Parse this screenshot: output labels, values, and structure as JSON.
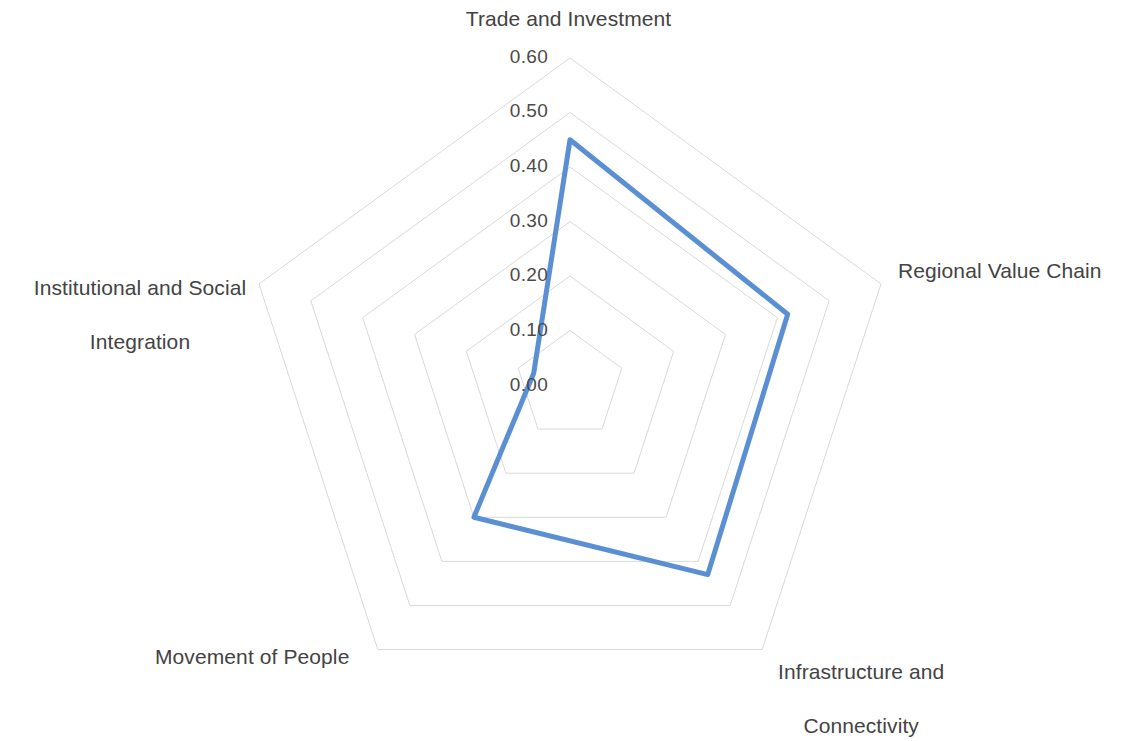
{
  "chart_data": {
    "type": "radar",
    "title": "",
    "subtitle": "",
    "categories": [
      "Trade and Investment",
      "Regional Value Chain",
      "Infrastructure and\nConnectivity",
      "Movement of People",
      "Institutional and Social\nIntegration"
    ],
    "series": [
      {
        "name": "Integration Index",
        "values": [
          0.45,
          0.42,
          0.43,
          0.3,
          0.07
        ],
        "color": "#5B8FD3",
        "line_width": 5,
        "fill": "none"
      }
    ],
    "tick_labels": [
      "0.00",
      "0.10",
      "0.20",
      "0.30",
      "0.40",
      "0.50",
      "0.60"
    ],
    "tick_values": [
      0.0,
      0.1,
      0.2,
      0.3,
      0.4,
      0.5,
      0.6
    ],
    "rlim": [
      0.0,
      0.6
    ],
    "r_step": 0.1,
    "grid": true,
    "grid_color": "#d9d9d9",
    "legend": "none",
    "xlabel": "",
    "ylabel": "",
    "background": "#ffffff",
    "text_color": "#434343"
  },
  "axis_labels": {
    "top": "Trade and Investment",
    "right": "Regional Value Chain",
    "bottom_right_line1": "Infrastructure and",
    "bottom_right_line2": "Connectivity",
    "bottom_left": "Movement of People",
    "left_line1": "Institutional and Social",
    "left_line2": "Integration"
  },
  "ticks": {
    "t0": "0.00",
    "t1": "0.10",
    "t2": "0.20",
    "t3": "0.30",
    "t4": "0.40",
    "t5": "0.50",
    "t6": "0.60"
  }
}
